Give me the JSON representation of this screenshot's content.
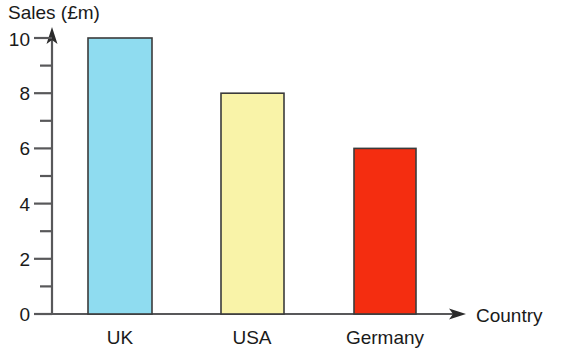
{
  "chart_data": {
    "type": "bar",
    "title": "",
    "categories": [
      "UK",
      "USA",
      "Germany"
    ],
    "values": [
      10,
      8,
      6
    ],
    "xlabel": "Country",
    "ylabel": "Sales (£m)",
    "ylim": [
      0,
      11
    ],
    "ytick_labels": [
      "0",
      "2",
      "4",
      "6",
      "8",
      "10"
    ],
    "ytick_values": [
      0,
      2,
      4,
      6,
      8,
      10
    ],
    "yminor_values": [
      1,
      3,
      5,
      7,
      9
    ],
    "grid": false,
    "legend": null,
    "bar_colors": [
      "#8fdcf0",
      "#f9f3a8",
      "#f42d10"
    ],
    "bar_outline_color": "#3b3b3b",
    "axis_color": "#58585a",
    "background_color": "#ffffff",
    "series": [
      {
        "name": "Sales",
        "values": [
          10,
          8,
          6
        ]
      }
    ]
  },
  "axes": {
    "y_axis_label": "Sales (£m)",
    "x_axis_label": "Country"
  }
}
